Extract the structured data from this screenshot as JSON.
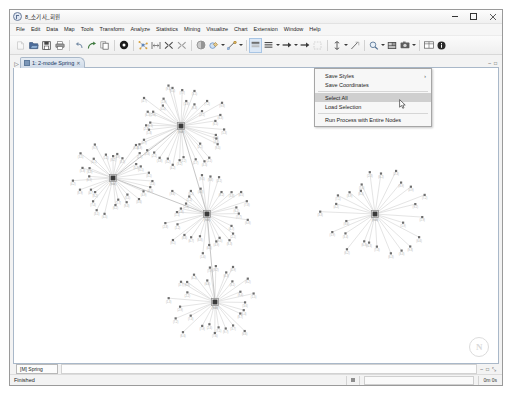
{
  "window": {
    "title": "8_소기사_회원",
    "app_icon": "netminer-logo-icon",
    "controls": {
      "minimize": "minimize-icon",
      "maximize": "maximize-icon",
      "close": "close-icon"
    }
  },
  "menubar": {
    "items": [
      {
        "label": "File"
      },
      {
        "label": "Edit"
      },
      {
        "label": "Data"
      },
      {
        "label": "Map"
      },
      {
        "label": "Tools"
      },
      {
        "label": "Transform"
      },
      {
        "label": "Analyze"
      },
      {
        "label": "Statistics"
      },
      {
        "label": "Mining"
      },
      {
        "label": "Visualize"
      },
      {
        "label": "Chart"
      },
      {
        "label": "Extension"
      },
      {
        "label": "Window"
      },
      {
        "label": "Help"
      }
    ]
  },
  "toolbar": {
    "groups": [
      {
        "buttons": [
          {
            "name": "new-file-icon",
            "state": "disabled"
          },
          {
            "name": "open-file-icon",
            "state": "normal"
          },
          {
            "name": "save-icon",
            "state": "normal"
          },
          {
            "name": "print-icon",
            "state": "normal"
          }
        ]
      },
      {
        "buttons": [
          {
            "name": "undo-icon",
            "state": "normal"
          },
          {
            "name": "redo-icon",
            "state": "normal"
          },
          {
            "name": "copy-icon",
            "state": "normal"
          }
        ]
      },
      {
        "buttons": [
          {
            "name": "run-process-icon",
            "state": "normal"
          }
        ]
      },
      {
        "buttons": [
          {
            "name": "spring-layout-icon",
            "state": "normal"
          },
          {
            "name": "fit-to-window-icon",
            "state": "normal"
          },
          {
            "name": "select-nodes-icon",
            "state": "normal"
          },
          {
            "name": "deselect-nodes-icon",
            "state": "normal"
          }
        ]
      },
      {
        "buttons": [
          {
            "name": "node-color-icon",
            "state": "normal"
          },
          {
            "name": "node-style-icon",
            "state": "normal",
            "dropdown": true
          },
          {
            "name": "link-style-icon",
            "state": "normal",
            "dropdown": true
          }
        ]
      },
      {
        "buttons": [
          {
            "name": "node-label-icon",
            "state": "selected"
          },
          {
            "name": "link-label-icon",
            "state": "normal",
            "dropdown": true
          },
          {
            "name": "arrow-style-icon",
            "state": "normal",
            "dropdown": true
          },
          {
            "name": "arrow-direction-icon",
            "state": "normal"
          },
          {
            "name": "bounding-box-icon",
            "state": "disabled"
          }
        ]
      },
      {
        "buttons": [
          {
            "name": "node-size-icon",
            "state": "normal",
            "dropdown": true
          },
          {
            "name": "link-width-icon",
            "state": "normal"
          }
        ]
      },
      {
        "buttons": [
          {
            "name": "zoom-icon",
            "state": "normal",
            "dropdown": true
          },
          {
            "name": "export-image-icon",
            "state": "normal"
          },
          {
            "name": "capture-icon",
            "state": "normal",
            "dropdown": true
          }
        ]
      },
      {
        "buttons": [
          {
            "name": "data-table-icon",
            "state": "normal"
          },
          {
            "name": "info-icon",
            "state": "normal"
          }
        ]
      }
    ]
  },
  "tabs": {
    "pin_icon": "pin-icon",
    "items": [
      {
        "label": "1: 2-mode Spring",
        "active": true,
        "close_icon": "close-tab-icon"
      }
    ],
    "right_controls": [
      {
        "name": "restore-pane-icon",
        "glyph": "–"
      },
      {
        "name": "maximize-pane-icon",
        "glyph": "□"
      }
    ]
  },
  "context_menu": {
    "items": [
      {
        "label": "Save Styles",
        "has_submenu": true,
        "highlighted": false,
        "separator_after": false
      },
      {
        "label": "Save Coordinates",
        "has_submenu": false,
        "highlighted": false,
        "separator_after": true
      },
      {
        "label": "Select All",
        "has_submenu": false,
        "highlighted": true,
        "separator_after": false
      },
      {
        "label": "Load Selection",
        "has_submenu": false,
        "highlighted": false,
        "separator_after": true
      },
      {
        "label": "Run Process with Entire Nodes",
        "has_submenu": false,
        "highlighted": false,
        "separator_after": false
      }
    ],
    "cursor_icon": "mouse-pointer-icon"
  },
  "canvas": {
    "watermark_text": "N",
    "watermark_name": "netminer-watermark-logo"
  },
  "layout_strip": {
    "layout_label": "[M] Spring",
    "controls": [
      {
        "name": "pane-restore-icon",
        "glyph": "–"
      },
      {
        "name": "pane-maximize-icon",
        "glyph": "□"
      },
      {
        "name": "pane-float-icon",
        "glyph": "⤡"
      }
    ]
  },
  "statusbar": {
    "message": "Finished",
    "elapsed_time": "0m 0s",
    "progress_icon": "progress-stop-icon"
  },
  "graph_data": {
    "type": "node-link-network",
    "hubs": [
      {
        "id": "hub-1",
        "x": 181,
        "y": 126,
        "leaves": 36
      },
      {
        "id": "hub-2",
        "x": 113,
        "y": 178,
        "leaves": 30
      },
      {
        "id": "hub-3",
        "x": 207,
        "y": 214,
        "leaves": 30
      },
      {
        "id": "hub-4",
        "x": 215,
        "y": 302,
        "leaves": 28
      },
      {
        "id": "hub-5",
        "x": 375,
        "y": 214,
        "leaves": 26
      }
    ],
    "hub_links": [
      [
        "hub-1",
        "hub-2"
      ],
      [
        "hub-1",
        "hub-3"
      ],
      [
        "hub-2",
        "hub-3"
      ],
      [
        "hub-3",
        "hub-4"
      ]
    ],
    "node_color": "#3a3a3a",
    "leaf_color": "#6e6e6e",
    "link_color": "#c3c3c3"
  }
}
